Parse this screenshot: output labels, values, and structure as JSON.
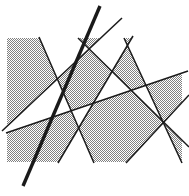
{
  "figure": {
    "type": "geometric-line-arrangement",
    "width": 189,
    "height": 196,
    "background_color": "#ffffff",
    "shading": {
      "name": "checkerboard-halftone",
      "fill_color": "#808080",
      "pattern_size": 2,
      "description": "fine 1px checkerboard halftone stipple"
    },
    "shaded_rect": {
      "x": 7,
      "y": 38,
      "width": 175,
      "height": 124
    },
    "line_color": "#1a1a1a",
    "lines": [
      {
        "name": "thick-steep-line",
        "x1": 100,
        "y1": 6,
        "x2": 23,
        "y2": 186,
        "width": 3.4
      },
      {
        "name": "long-shallow-line-upper",
        "x1": 122,
        "y1": 18,
        "x2": 2,
        "y2": 131,
        "width": 1.5
      },
      {
        "name": "long-shallow-line-lower",
        "x1": 188,
        "y1": 71,
        "x2": 6,
        "y2": 133,
        "width": 1.5
      },
      {
        "name": "left-descending-line",
        "x1": 39,
        "y1": 37,
        "x2": 94,
        "y2": 163,
        "width": 1.5
      },
      {
        "name": "center-descending-line",
        "x1": 78,
        "y1": 38,
        "x2": 189,
        "y2": 147,
        "width": 1.5
      },
      {
        "name": "right-descending-line",
        "x1": 124,
        "y1": 38,
        "x2": 182,
        "y2": 163,
        "width": 1.5
      },
      {
        "name": "center-ascending-line",
        "x1": 58,
        "y1": 163,
        "x2": 133,
        "y2": 36,
        "width": 1.5
      },
      {
        "name": "right-ascending-line",
        "x1": 126,
        "y1": 163,
        "x2": 189,
        "y2": 95,
        "width": 1.5
      }
    ]
  }
}
